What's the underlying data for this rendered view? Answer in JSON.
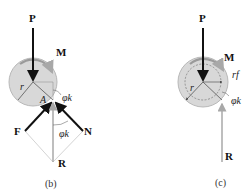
{
  "panels": [
    {
      "id": "b",
      "caption": "(b)",
      "labels": {
        "load": "P",
        "moment": "M",
        "radius": "r",
        "contact_point": "A",
        "angle": "φk",
        "angle_lower": "φk",
        "friction": "F",
        "normal": "N",
        "resultant": "R"
      }
    },
    {
      "id": "c",
      "caption": "(c)",
      "labels": {
        "load": "P",
        "moment": "M",
        "radius": "r",
        "friction_circle_radius": "rf",
        "angle": "φk",
        "resultant": "R"
      }
    }
  ],
  "colors": {
    "journal_fill": "#d8d8d8",
    "journal_stroke": "#b0b0b0",
    "force_dark": "#111111",
    "force_gray": "#a8a8a8",
    "construction": "#c8c8c8"
  }
}
